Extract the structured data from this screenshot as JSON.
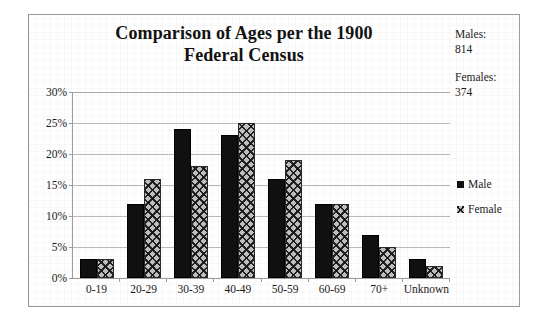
{
  "chart_data": {
    "type": "bar",
    "title": "Comparison of Ages per the 1900 Federal Census",
    "title_line1": "Comparison of Ages per the 1900",
    "title_line2": "Federal Census",
    "xlabel": "",
    "ylabel": "",
    "ylim": [
      0,
      30
    ],
    "ytick_labels": [
      "30%",
      "25%",
      "20%",
      "15%",
      "10%",
      "5%",
      "0%"
    ],
    "ytick_values": [
      30,
      25,
      20,
      15,
      10,
      5,
      0
    ],
    "grid": true,
    "legend_position": "right",
    "categories": [
      "0-19",
      "20-29",
      "30-39",
      "40-49",
      "50-59",
      "60-69",
      "70+",
      "Unknown"
    ],
    "series": [
      {
        "name": "Male",
        "color": "#101010",
        "pattern": "solid",
        "values": [
          3,
          12,
          24,
          23,
          16,
          12,
          7,
          3
        ]
      },
      {
        "name": "Female",
        "color": "#bdbdbd",
        "pattern": "crosshatch",
        "values": [
          3,
          16,
          18,
          25,
          19,
          12,
          5,
          2
        ]
      }
    ],
    "annotations": [
      {
        "name": "males-total",
        "label": "Males:",
        "value": "814",
        "text": "Males:\n814"
      },
      {
        "name": "females-total",
        "label": "Females:",
        "value": "374",
        "text": "Females:\n374"
      }
    ]
  }
}
